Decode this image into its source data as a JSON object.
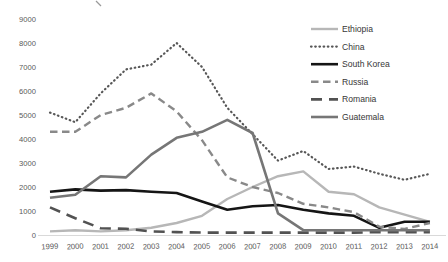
{
  "chart_data": {
    "type": "line",
    "title": "",
    "xlabel": "",
    "ylabel": "",
    "x_categories": [
      "1999",
      "2000",
      "2001",
      "2002",
      "2003",
      "2004",
      "2005",
      "2006",
      "2007",
      "2008",
      "2009",
      "2010",
      "2011",
      "2012",
      "2013",
      "2014"
    ],
    "y_ticks": [
      0,
      1000,
      2000,
      3000,
      4000,
      5000,
      6000,
      7000,
      8000,
      9000
    ],
    "ylim": [
      0,
      9000
    ],
    "grid": "off",
    "legend_position": "top-right",
    "series": [
      {
        "name": "Ethiopia",
        "color": "#b7b7b7",
        "style": "solid",
        "width": 2.4,
        "values": [
          150,
          200,
          150,
          200,
          300,
          500,
          800,
          1500,
          2000,
          2450,
          2650,
          1800,
          1700,
          1150,
          850,
          550
        ]
      },
      {
        "name": "China",
        "color": "#575757",
        "style": "dotted",
        "width": 2.2,
        "values": [
          5100,
          4700,
          5900,
          6900,
          7100,
          8000,
          7000,
          5300,
          4200,
          3100,
          3500,
          2750,
          2850,
          2550,
          2300,
          2550
        ]
      },
      {
        "name": "South Korea",
        "color": "#151515",
        "style": "solid",
        "width": 2.6,
        "values": [
          1800,
          1900,
          1850,
          1870,
          1800,
          1750,
          1400,
          1050,
          1200,
          1250,
          1050,
          900,
          800,
          300,
          550,
          550
        ]
      },
      {
        "name": "Russia",
        "color": "#898989",
        "style": "dashed",
        "width": 2.4,
        "values": [
          4300,
          4300,
          5000,
          5300,
          5900,
          5150,
          3950,
          2400,
          2000,
          1750,
          1300,
          1150,
          950,
          350,
          250,
          500
        ]
      },
      {
        "name": "Romania",
        "color": "#525252",
        "style": "longdash",
        "width": 2.6,
        "values": [
          1150,
          700,
          280,
          260,
          150,
          120,
          100,
          100,
          100,
          100,
          100,
          100,
          100,
          120,
          120,
          120
        ]
      },
      {
        "name": "Guatemala",
        "color": "#767676",
        "style": "solid",
        "width": 2.6,
        "values": [
          1550,
          1680,
          2450,
          2400,
          3350,
          4050,
          4300,
          4800,
          4250,
          900,
          200,
          200,
          200,
          200,
          200,
          200
        ]
      }
    ],
    "axis_line_color": "#d9d9d9",
    "tick_label_color": "#595959",
    "legend_label_color": "#373737"
  }
}
